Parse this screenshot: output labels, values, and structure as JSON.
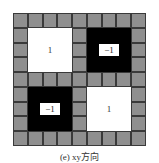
{
  "diagram": {
    "grid_size": 9,
    "background_cell_color": "#8f8f8f",
    "blocks": [
      {
        "position": "top-left",
        "fill": "white",
        "value": "1"
      },
      {
        "position": "top-right",
        "fill": "black",
        "value": "−1"
      },
      {
        "position": "bottom-left",
        "fill": "black",
        "value": "−1"
      },
      {
        "position": "bottom-right",
        "fill": "white",
        "value": "1"
      }
    ],
    "caption": "(e) xy方向"
  }
}
